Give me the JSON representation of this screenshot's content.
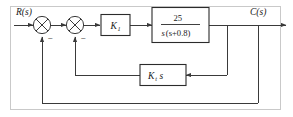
{
  "diagram": {
    "kind": "control-system-block-diagram",
    "input_label": "R(s)",
    "output_label": "C(s)",
    "forward_gain_label": "K",
    "forward_gain_subscript": "1",
    "plant_numerator": "25",
    "plant_denominator_var": "s",
    "plant_denominator_factor": "(s+0.8)",
    "plant_transfer_function": "25 / (s(s+0.8))",
    "feedback_gain_label": "K",
    "feedback_gain_subscript": "t",
    "feedback_gain_suffix": "s",
    "feedback_block_expression": "K_t s",
    "inner_sum_sign": "−",
    "outer_sum_sign": "−",
    "summing_junction_count": "2",
    "colors": {
      "wire": "#3a3a3a",
      "block_border": "#2b2b2b",
      "block_fill": "#ffffff",
      "text": "#1a1a1a",
      "frame": "#c9c9c9",
      "background": "#ffffff"
    }
  }
}
